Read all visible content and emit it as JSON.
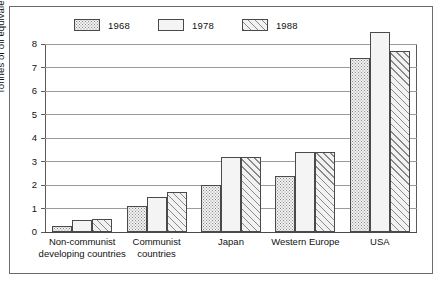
{
  "chart_data": {
    "type": "bar",
    "title": "",
    "subtitle": "",
    "xlabel": "",
    "ylabel": "Tonnes of oil equivalent",
    "ylim": [
      0,
      8
    ],
    "yticks": [
      0,
      1,
      2,
      3,
      4,
      5,
      6,
      7,
      8
    ],
    "ytick_labels": [
      "0",
      "1",
      "2",
      "3",
      "4",
      "5",
      "6",
      "7",
      "8"
    ],
    "grid": true,
    "legend_position": "top-left",
    "categories": [
      "Non-communist\ndeveloping countries",
      "Communist\ncountries",
      "Japan",
      "Western Europe",
      "USA"
    ],
    "series": [
      {
        "name": "1968",
        "pattern": "dots",
        "values": [
          0.25,
          1.1,
          2.0,
          2.4,
          7.4
        ]
      },
      {
        "name": "1978",
        "pattern": "blank",
        "values": [
          0.5,
          1.5,
          3.2,
          3.4,
          8.5
        ]
      },
      {
        "name": "1988",
        "pattern": "hatch",
        "values": [
          0.55,
          1.7,
          3.2,
          3.4,
          7.7
        ]
      }
    ]
  },
  "legend": {
    "items": [
      {
        "label": "1968",
        "pattern": "dots"
      },
      {
        "label": "1978",
        "pattern": "blank"
      },
      {
        "label": "1988",
        "pattern": "hatch"
      }
    ]
  },
  "axes": {
    "y_axis_title": "Tonnes of oil equivalent",
    "y_tick_labels": [
      "8",
      "7",
      "6",
      "5",
      "4",
      "3",
      "2",
      "1",
      "0"
    ],
    "x_tick_labels": [
      "Non-communist\ndeveloping countries",
      "Communist\ncountries",
      "Japan",
      "Western Europe",
      "USA"
    ]
  },
  "colors": {
    "background": "#ffffff",
    "frame": "#6b6b6b",
    "axis": "#4a4a4a",
    "gridline": "#9b9b9b",
    "bar_outline": "#4a4a4a",
    "pattern_ink": "#8a8a8a",
    "bar_fill": "#f2f2f2"
  }
}
